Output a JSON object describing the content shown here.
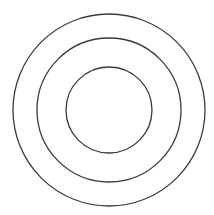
{
  "diagram": {
    "type": "concentric-circles",
    "background": "#ffffff",
    "stroke_color": "#3a3a3a",
    "center": [
      109,
      110
    ],
    "circles": [
      {
        "name": "outer",
        "r": 96
      },
      {
        "name": "middle",
        "r": 72
      },
      {
        "name": "inner",
        "r": 43
      }
    ]
  }
}
